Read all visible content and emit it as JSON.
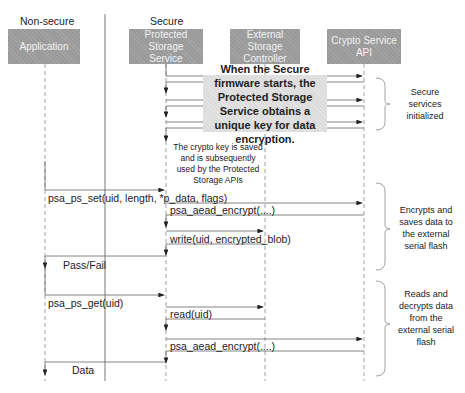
{
  "zones": {
    "non_secure": "Non-secure",
    "secure": "Secure"
  },
  "actors": [
    {
      "id": "application",
      "label": "Application"
    },
    {
      "id": "protected_storage_service",
      "label": "Protected Storage Service"
    },
    {
      "id": "external_storage_controller",
      "label": "External Storage Controller"
    },
    {
      "id": "crypto_service_api",
      "label": "Crypto Service API"
    }
  ],
  "init_note": "When the Secure firmware starts, the Protected Storage Service obtains a unique key for data encryption.",
  "key_note": "The crypto key is saved and is subsequently used by the Protected Storage APIs",
  "messages": {
    "ps_set": "psa_ps_set(uid, length, *p_data, flags)",
    "aead_encrypt_1": "psa_aead_encrypt(....)",
    "write": "write(uid, encrypted_blob)",
    "pass_fail": "Pass/Fail",
    "ps_get": "psa_ps_get(uid)",
    "read": "read(uid)",
    "aead_encrypt_2": "psa_aead_encrypt(....)",
    "data": "Data"
  },
  "phases": [
    {
      "label": "Secure services initialized"
    },
    {
      "label": "Encrypts and saves data to the external serial flash"
    },
    {
      "label": "Reads and decrypts data from the external serial flash"
    }
  ],
  "colors": {
    "actor_fill": "#9a9a9a",
    "actor_text": "#f2f2f2",
    "note_fill": "#dcdcdc",
    "line": "#555555",
    "lifeline": "#888888"
  }
}
